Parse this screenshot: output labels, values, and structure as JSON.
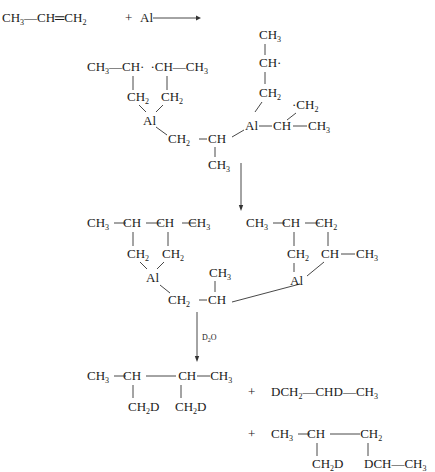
{
  "reactants": {
    "propylene": [
      "CH",
      "3",
      "—CH═CH",
      "2"
    ],
    "plus": "+",
    "aluminum": "Al"
  },
  "intermediate1": {
    "left_ring": {
      "row1": [
        "CH",
        "3",
        "—CH·",
        "·CH—CH",
        "3"
      ],
      "ch2_a": [
        "CH",
        "2"
      ],
      "ch2_b": [
        "CH",
        "2"
      ],
      "al": "Al"
    },
    "bridge": {
      "ch2": [
        "CH",
        "2"
      ],
      "ch": "CH",
      "ch3": [
        "CH",
        "3"
      ]
    },
    "right_group": {
      "ch3_top": [
        "CH",
        "3"
      ],
      "ch_radical": "CH·",
      "ch2": [
        "CH",
        "2"
      ],
      "radical_ch2": [
        "·CH",
        "2"
      ],
      "al": "Al",
      "ch": "CH",
      "ch3": [
        "CH",
        "3"
      ]
    }
  },
  "intermediate2": {
    "left_ring": {
      "row1": [
        "CH",
        "3",
        "CH",
        "CH",
        "CH",
        "3"
      ],
      "ch2_a": [
        "CH",
        "2"
      ],
      "ch2_b": [
        "CH",
        "2"
      ],
      "al": "Al"
    },
    "bridge": {
      "ch2": [
        "CH",
        "2"
      ],
      "ch": "CH",
      "ch3": [
        "CH",
        "3"
      ]
    },
    "right_ring": {
      "row1": [
        "CH",
        "3",
        "CH",
        "CH",
        "2"
      ],
      "ch2": [
        "CH",
        "2"
      ],
      "ch": "CH",
      "ch3": [
        "CH",
        "3"
      ],
      "al": "Al"
    }
  },
  "reagent": {
    "label": [
      "D",
      "2",
      "O"
    ]
  },
  "products": {
    "p1": {
      "row1": [
        "CH",
        "3",
        "CH",
        "CH",
        "CH",
        "3"
      ],
      "sub_a": [
        "CH",
        "2",
        "D"
      ],
      "sub_b": [
        "CH",
        "2",
        "D"
      ]
    },
    "p2": [
      "DCH",
      "2",
      "—CHD—CH",
      "3"
    ],
    "p3": {
      "row1": [
        "CH",
        "3",
        "CH",
        "CH",
        "2"
      ],
      "sub_a": [
        "CH",
        "2",
        "D"
      ],
      "sub_b": [
        "DCH—CH",
        "3"
      ]
    },
    "plus": "+"
  }
}
